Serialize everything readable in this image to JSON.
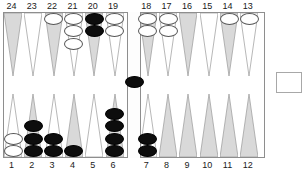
{
  "board": {
    "title": "backgammon-board",
    "colors": {
      "point_shaded": "#d9d9d9",
      "point_light": "#ffffff",
      "point_border": "#9a9a9a",
      "frame_border": "#8e8e8e",
      "checker_black": "#0d0d0d",
      "checker_white": "#ffffff",
      "label_text": "#1a1a1a"
    },
    "top_labels": [
      "24",
      "23",
      "22",
      "21",
      "20",
      "19",
      "18",
      "17",
      "16",
      "15",
      "14",
      "13"
    ],
    "bottom_labels": [
      "1",
      "2",
      "3",
      "4",
      "5",
      "6",
      "7",
      "8",
      "9",
      "10",
      "11",
      "12"
    ],
    "bar": {
      "label": "bar",
      "black_checkers": 1,
      "white_checkers": 0
    },
    "tray": {
      "label": "bear-off-tray",
      "checkers": 0
    },
    "points": [
      {
        "number": "24",
        "row": "top",
        "index": 0,
        "shaded": true,
        "color": "none",
        "count": 0
      },
      {
        "number": "23",
        "row": "top",
        "index": 1,
        "shaded": false,
        "color": "none",
        "count": 0
      },
      {
        "number": "22",
        "row": "top",
        "index": 2,
        "shaded": true,
        "color": "white",
        "count": 1
      },
      {
        "number": "21",
        "row": "top",
        "index": 3,
        "shaded": false,
        "color": "white",
        "count": 3
      },
      {
        "number": "20",
        "row": "top",
        "index": 4,
        "shaded": true,
        "color": "black",
        "count": 2
      },
      {
        "number": "19",
        "row": "top",
        "index": 5,
        "shaded": false,
        "color": "white",
        "count": 2
      },
      {
        "number": "18",
        "row": "top",
        "index": 6,
        "shaded": true,
        "color": "white",
        "count": 2
      },
      {
        "number": "17",
        "row": "top",
        "index": 7,
        "shaded": false,
        "color": "white",
        "count": 2
      },
      {
        "number": "16",
        "row": "top",
        "index": 8,
        "shaded": true,
        "color": "none",
        "count": 0
      },
      {
        "number": "15",
        "row": "top",
        "index": 9,
        "shaded": false,
        "color": "none",
        "count": 0
      },
      {
        "number": "14",
        "row": "top",
        "index": 10,
        "shaded": true,
        "color": "white",
        "count": 1
      },
      {
        "number": "13",
        "row": "top",
        "index": 11,
        "shaded": false,
        "color": "white",
        "count": 1
      },
      {
        "number": "1",
        "row": "bottom",
        "index": 0,
        "shaded": false,
        "color": "white",
        "count": 2
      },
      {
        "number": "2",
        "row": "bottom",
        "index": 1,
        "shaded": true,
        "color": "black",
        "count": 3
      },
      {
        "number": "3",
        "row": "bottom",
        "index": 2,
        "shaded": false,
        "color": "black",
        "count": 2
      },
      {
        "number": "4",
        "row": "bottom",
        "index": 3,
        "shaded": true,
        "color": "black",
        "count": 1
      },
      {
        "number": "5",
        "row": "bottom",
        "index": 4,
        "shaded": false,
        "color": "none",
        "count": 0
      },
      {
        "number": "6",
        "row": "bottom",
        "index": 5,
        "shaded": true,
        "color": "black",
        "count": 4
      },
      {
        "number": "7",
        "row": "bottom",
        "index": 6,
        "shaded": false,
        "color": "black",
        "count": 2
      },
      {
        "number": "8",
        "row": "bottom",
        "index": 7,
        "shaded": true,
        "color": "none",
        "count": 0
      },
      {
        "number": "9",
        "row": "bottom",
        "index": 8,
        "shaded": true,
        "color": "none",
        "count": 0
      },
      {
        "number": "10",
        "row": "bottom",
        "index": 9,
        "shaded": true,
        "color": "none",
        "count": 0
      },
      {
        "number": "11",
        "row": "bottom",
        "index": 10,
        "shaded": true,
        "color": "none",
        "count": 0
      },
      {
        "number": "12",
        "row": "bottom",
        "index": 11,
        "shaded": true,
        "color": "none",
        "count": 0
      }
    ]
  }
}
